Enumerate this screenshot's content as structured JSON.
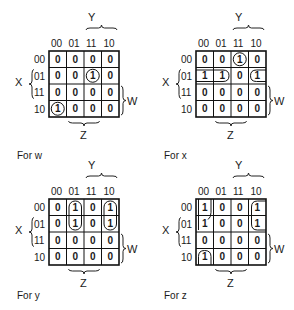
{
  "col_headers": [
    "00",
    "01",
    "11",
    "10"
  ],
  "row_headers": [
    "00",
    "01",
    "11",
    "10"
  ],
  "axis_labels": {
    "top": "Y",
    "left": "X",
    "right": "W",
    "bottom": "Z"
  },
  "maps": [
    {
      "caption": "For w",
      "grid": [
        [
          "0",
          "0",
          "0",
          "0"
        ],
        [
          "0",
          "0",
          "1",
          "0"
        ],
        [
          "0",
          "0",
          "0",
          "0"
        ],
        [
          "1",
          "0",
          "0",
          "0"
        ]
      ],
      "groups": [
        {
          "type": "circle",
          "row": 1,
          "col": 2
        },
        {
          "type": "circle",
          "row": 3,
          "col": 0
        }
      ]
    },
    {
      "caption": "For x",
      "grid": [
        [
          "0",
          "0",
          "1",
          "0"
        ],
        [
          "1",
          "1",
          "0",
          "1"
        ],
        [
          "0",
          "0",
          "0",
          "0"
        ],
        [
          "0",
          "0",
          "0",
          "0"
        ]
      ],
      "groups": [
        {
          "type": "circle",
          "row": 0,
          "col": 2
        },
        {
          "type": "wrap-horizontal",
          "row": 1,
          "cols": [
            0,
            1
          ],
          "wrap_col": 3
        }
      ]
    },
    {
      "caption": "For y",
      "grid": [
        [
          "0",
          "1",
          "0",
          "1"
        ],
        [
          "0",
          "1",
          "0",
          "1"
        ],
        [
          "0",
          "0",
          "0",
          "0"
        ],
        [
          "0",
          "0",
          "0",
          "0"
        ]
      ],
      "groups": [
        {
          "type": "vertical",
          "col": 1,
          "rows": [
            0,
            1
          ]
        },
        {
          "type": "vertical",
          "col": 3,
          "rows": [
            0,
            1
          ]
        }
      ]
    },
    {
      "caption": "For z",
      "grid": [
        [
          "1",
          "0",
          "0",
          "1"
        ],
        [
          "1",
          "0",
          "0",
          "1"
        ],
        [
          "0",
          "0",
          "0",
          "0"
        ],
        [
          "1",
          "0",
          "0",
          "0"
        ]
      ],
      "groups": [
        {
          "type": "wrap-vertical",
          "col": 0,
          "rows": [
            0,
            1
          ],
          "wrap_row": 3
        },
        {
          "type": "vertical-open-right",
          "col": 3,
          "rows": [
            0,
            1
          ]
        }
      ]
    }
  ]
}
